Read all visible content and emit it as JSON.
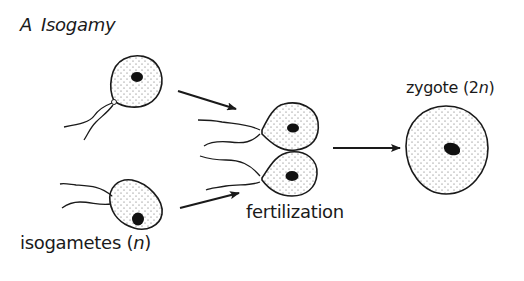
{
  "figure": {
    "panel_letter": "A",
    "title": "Isogamy",
    "labels": {
      "isogametes": "isogametes (",
      "isogametes_var": "n",
      "isogametes_close": ")",
      "fertilization": "fertilization",
      "zygote": "zygote (2",
      "zygote_var": "n",
      "zygote_close": ")"
    },
    "stages": [
      "isogametes (n)",
      "fertilization",
      "zygote (2n)"
    ],
    "colors": {
      "line": "#1a1a1a",
      "nucleus": "#111111",
      "stipple": "#555555",
      "background": "#ffffff"
    }
  }
}
